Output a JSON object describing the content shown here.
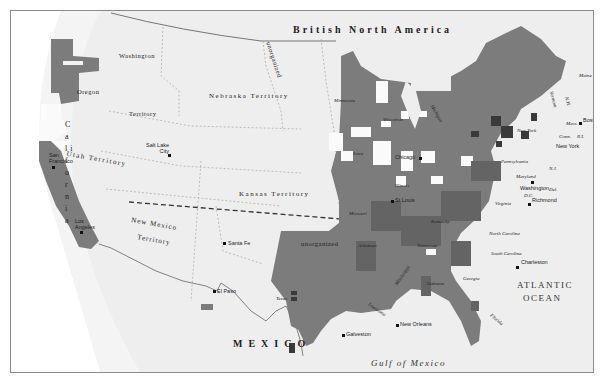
{
  "map": {
    "title_regions": {
      "british_north_america": "British North America",
      "mexico": "MEXICO",
      "gulf_of_mexico": "Gulf of Mexico",
      "atlantic_line1": "ATLANTIC",
      "atlantic_line2": "OCEAN"
    },
    "territories": {
      "washington": "Washington",
      "washington_territory": "Territory",
      "oregon": "Oregon",
      "nebraska": "Nebraska Territory",
      "unorganized_north": "unorganized",
      "utah": "Utah Territory",
      "kansas": "Kansas Territory",
      "new_mexico": "New Mexico",
      "new_mexico_territory": "Territory",
      "unorganized_south": "unorganized",
      "california": "C a l i f o r n i a"
    },
    "states": {
      "minnesota": "Minnesota",
      "wisconsin": "Wisconsin",
      "michigan": "Michigan",
      "iowa": "Iowa",
      "illinois": "Illinois",
      "missouri": "Missouri",
      "kentucky": "Kentucky",
      "tennessee": "Tennessee",
      "arkansas": "Arkansas",
      "texas": "Texas",
      "louisiana": "Louisiana",
      "mississippi": "Mississippi",
      "alabama": "Alabama",
      "georgia": "Georgia",
      "florida": "Florida",
      "south_carolina": "South Carolina",
      "north_carolina": "North Carolina",
      "virginia": "Virginia",
      "maryland": "Maryland",
      "delaware": "Del.",
      "new_jersey": "N.J.",
      "pennsylvania": "Pennsylvania",
      "new_york_state": "New York",
      "vermont": "Vermont",
      "new_hampshire": "N.H.",
      "maine": "Maine",
      "massachusetts": "Mass.",
      "connecticut": "Conn.",
      "rhode_island": "R.I.",
      "dc": "D.C."
    },
    "cities": {
      "san_francisco": "San Francisco",
      "los_angeles": "Los Angeles",
      "salt_lake_city": "Salt Lake City",
      "santa_fe": "Santa Fe",
      "el_paso": "El Paso",
      "galveston": "Galveston",
      "new_orleans": "New Orleans",
      "st_louis": "St Louis",
      "chicago": "Chicago",
      "charleston": "Charleston",
      "richmond": "Richmond",
      "washington_dc": "Washington",
      "new_york_city": "New York",
      "boston": "Boston"
    },
    "colors": {
      "background": "#eeeeee",
      "frame": "#8a8a8a",
      "shade_dark": "#3a3a3a",
      "shade_medium": "#7c7c7c",
      "shade_mid_dark": "#646464",
      "shade_light_white": "#fafafa",
      "border_line": "#666666"
    }
  }
}
